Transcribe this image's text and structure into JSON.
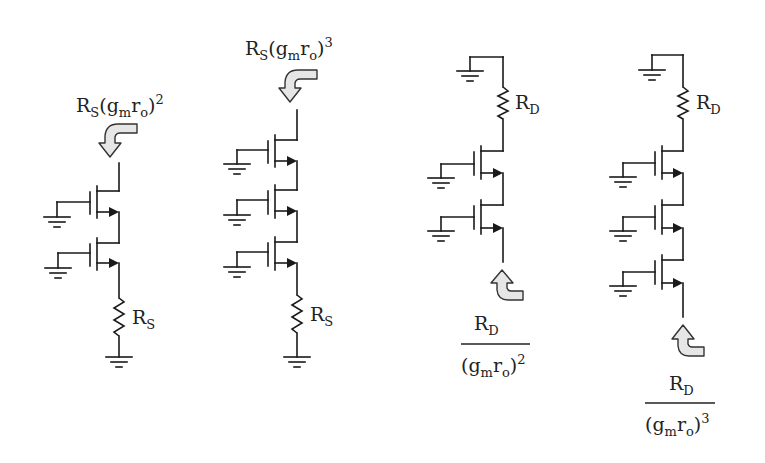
{
  "figure": {
    "circuits": [
      {
        "id": "c1",
        "type": "source-degenerated cascode (looking into drain)",
        "transistor_count": 2,
        "resistor": {
          "symbol": "R",
          "subscript": "S"
        },
        "impedance_label": {
          "base": "R",
          "base_sub": "S",
          "paren_open": "(",
          "g": "g",
          "g_sub": "m",
          "r": "r",
          "r_sub": "o",
          "paren_close": ")",
          "exponent": "2"
        }
      },
      {
        "id": "c2",
        "type": "source-degenerated cascode (looking into drain)",
        "transistor_count": 3,
        "resistor": {
          "symbol": "R",
          "subscript": "S"
        },
        "impedance_label": {
          "base": "R",
          "base_sub": "S",
          "paren_open": "(",
          "g": "g",
          "g_sub": "m",
          "r": "r",
          "r_sub": "o",
          "paren_close": ")",
          "exponent": "3"
        }
      },
      {
        "id": "c3",
        "type": "drain-loaded stack (looking into source)",
        "transistor_count": 2,
        "resistor": {
          "symbol": "R",
          "subscript": "D"
        },
        "impedance_label": {
          "num": "R",
          "num_sub": "D",
          "paren_open": "(",
          "g": "g",
          "g_sub": "m",
          "r": "r",
          "r_sub": "o",
          "paren_close": ")",
          "exponent": "2"
        }
      },
      {
        "id": "c4",
        "type": "drain-loaded stack (looking into source)",
        "transistor_count": 3,
        "resistor": {
          "symbol": "R",
          "subscript": "D"
        },
        "impedance_label": {
          "num": "R",
          "num_sub": "D",
          "paren_open": "(",
          "g": "g",
          "g_sub": "m",
          "r": "r",
          "r_sub": "o",
          "paren_close": ")",
          "exponent": "3"
        }
      }
    ],
    "colors": {
      "wire": "#1a1a1a",
      "arrow_fill": "#e6e6e6",
      "arrow_stroke": "#333333",
      "text": "#222222",
      "background": "#ffffff"
    }
  }
}
